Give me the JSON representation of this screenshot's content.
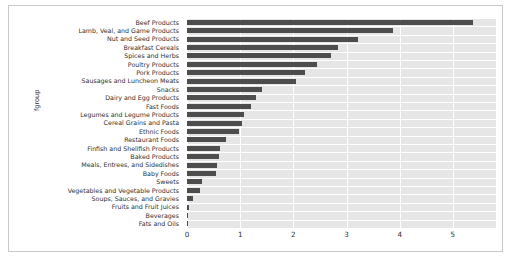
{
  "chart_data": {
    "type": "bar",
    "orientation": "horizontal",
    "title": "",
    "xlabel": "",
    "ylabel": "fgroup",
    "xlim": [
      0,
      5.81
    ],
    "xticks": [
      0,
      1,
      2,
      3,
      4,
      5
    ],
    "xticklabels": [
      "0",
      "1",
      "2",
      "3",
      "4",
      "5"
    ],
    "grid": true,
    "grid_axis": "x",
    "legend": null,
    "bar_color": "#4d4d4d",
    "plot_background": "#e6e6e6",
    "gridline_color": "#ffffff",
    "categories": [
      "Beef Products",
      "Lamb, Veal, and Game Products",
      "Nut and Seed Products",
      "Breakfast Cereals",
      "Spices and Herbs",
      "Poultry Products",
      "Pork Products",
      "Sausages and Luncheon Meats",
      "Snacks",
      "Dairy and Egg Products",
      "Fast Foods",
      "Legumes and Legume Products",
      "Cereal Grains and Pasta",
      "Ethnic Foods",
      "Restaurant Foods",
      "Finfish and Shellfish Products",
      "Baked Products",
      "Meals, Entrees, and Sidedishes",
      "Baby Foods",
      "Sweets",
      "Vegetables and Vegetable Products",
      "Soups, Sauces, and Gravies",
      "Fruits and Fruit Juices",
      "Beverages",
      "Fats and Oils"
    ],
    "values": [
      5.38,
      3.87,
      3.21,
      2.84,
      2.71,
      2.45,
      2.22,
      2.05,
      1.41,
      1.3,
      1.2,
      1.07,
      1.03,
      0.98,
      0.73,
      0.62,
      0.61,
      0.56,
      0.55,
      0.29,
      0.25,
      0.11,
      0.04,
      0.02,
      0.01
    ]
  }
}
